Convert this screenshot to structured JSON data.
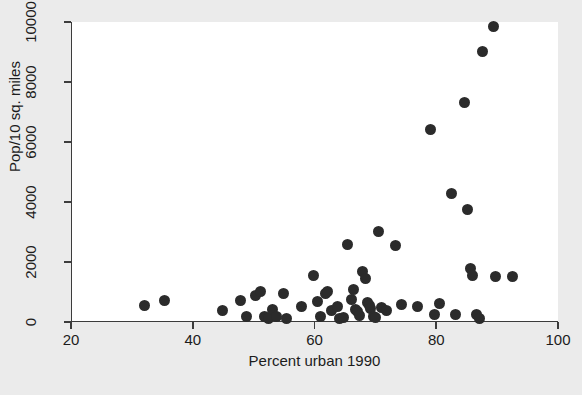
{
  "chart_data": {
    "type": "scatter",
    "title": "",
    "xlabel": "Percent urban 1990",
    "ylabel": "Pop/10 sq. miles",
    "xlim": [
      20,
      100
    ],
    "ylim": [
      0,
      10000
    ],
    "xticks": [
      20,
      40,
      60,
      80,
      100
    ],
    "yticks": [
      0,
      2000,
      4000,
      6000,
      8000,
      10000
    ],
    "grid": false,
    "legend": null,
    "marker": {
      "shape": "circle",
      "color": "#2b2b2b",
      "size_px": 11
    },
    "background": {
      "figure": "#ebebeb",
      "axes": "#ffffff",
      "axis_line": "#3c3c3c"
    },
    "points": [
      {
        "x": 31.9,
        "y": 560
      },
      {
        "x": 35.2,
        "y": 730
      },
      {
        "x": 44.8,
        "y": 370
      },
      {
        "x": 47.6,
        "y": 710
      },
      {
        "x": 48.6,
        "y": 200
      },
      {
        "x": 50.2,
        "y": 880
      },
      {
        "x": 50.9,
        "y": 1010
      },
      {
        "x": 51.6,
        "y": 200
      },
      {
        "x": 52.3,
        "y": 130
      },
      {
        "x": 52.9,
        "y": 430
      },
      {
        "x": 53.6,
        "y": 190
      },
      {
        "x": 54.8,
        "y": 960
      },
      {
        "x": 55.2,
        "y": 120
      },
      {
        "x": 57.7,
        "y": 520
      },
      {
        "x": 59.6,
        "y": 1540
      },
      {
        "x": 60.3,
        "y": 690
      },
      {
        "x": 60.9,
        "y": 170
      },
      {
        "x": 61.6,
        "y": 950
      },
      {
        "x": 62.0,
        "y": 1030
      },
      {
        "x": 62.6,
        "y": 400
      },
      {
        "x": 63.6,
        "y": 530
      },
      {
        "x": 64.0,
        "y": 120
      },
      {
        "x": 64.6,
        "y": 150
      },
      {
        "x": 65.3,
        "y": 2580
      },
      {
        "x": 65.9,
        "y": 740
      },
      {
        "x": 66.2,
        "y": 1080
      },
      {
        "x": 66.6,
        "y": 430
      },
      {
        "x": 66.9,
        "y": 360
      },
      {
        "x": 67.3,
        "y": 230
      },
      {
        "x": 67.8,
        "y": 1700
      },
      {
        "x": 68.2,
        "y": 1460
      },
      {
        "x": 68.5,
        "y": 640
      },
      {
        "x": 68.8,
        "y": 540
      },
      {
        "x": 69.1,
        "y": 450
      },
      {
        "x": 69.5,
        "y": 170
      },
      {
        "x": 69.9,
        "y": 140
      },
      {
        "x": 70.4,
        "y": 3010
      },
      {
        "x": 70.9,
        "y": 480
      },
      {
        "x": 71.6,
        "y": 400
      },
      {
        "x": 73.2,
        "y": 2550
      },
      {
        "x": 74.1,
        "y": 580
      },
      {
        "x": 76.8,
        "y": 530
      },
      {
        "x": 78.9,
        "y": 6430
      },
      {
        "x": 79.6,
        "y": 250
      },
      {
        "x": 80.3,
        "y": 610
      },
      {
        "x": 82.4,
        "y": 4300
      },
      {
        "x": 83.0,
        "y": 260
      },
      {
        "x": 84.4,
        "y": 7330
      },
      {
        "x": 84.9,
        "y": 3760
      },
      {
        "x": 85.5,
        "y": 1770
      },
      {
        "x": 85.8,
        "y": 1560
      },
      {
        "x": 86.4,
        "y": 240
      },
      {
        "x": 87.0,
        "y": 110
      },
      {
        "x": 87.4,
        "y": 9010
      },
      {
        "x": 89.2,
        "y": 9850
      },
      {
        "x": 89.6,
        "y": 1520
      },
      {
        "x": 92.4,
        "y": 1510
      }
    ]
  }
}
